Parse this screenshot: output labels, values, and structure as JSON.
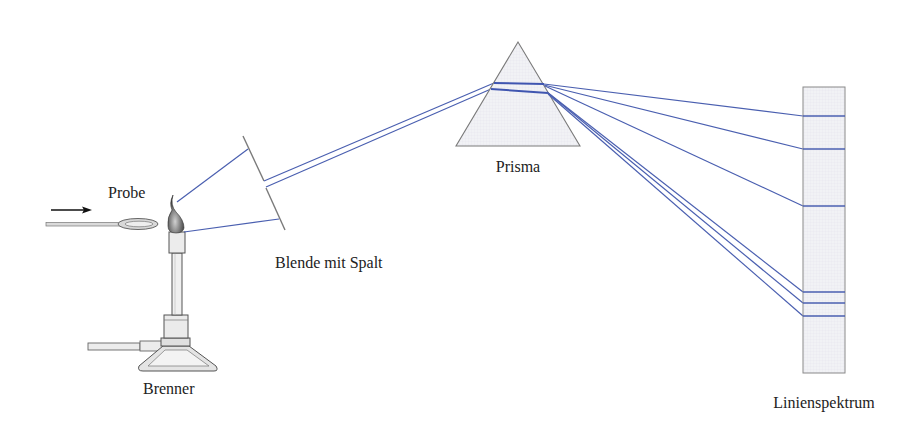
{
  "labels": {
    "probe": "Probe",
    "brenner": "Brenner",
    "blende": "Blende mit Spalt",
    "prisma": "Prisma",
    "spektrum": "Linienspektrum"
  },
  "colors": {
    "ray": "#4a5fb0",
    "outline": "#7a7a7a",
    "fill": "#eef0f4",
    "text": "#222222"
  },
  "components": [
    {
      "id": "probe",
      "description": "sample loop (spoon) with arrow pointing toward flame"
    },
    {
      "id": "brenner",
      "description": "Bunsen burner with flame"
    },
    {
      "id": "blende",
      "description": "aperture with slit"
    },
    {
      "id": "prisma",
      "description": "triangular prism dispersing light"
    },
    {
      "id": "spektrum",
      "description": "screen showing line spectrum"
    }
  ],
  "spectrum_lines_y": [
    116,
    149,
    206,
    292,
    303,
    316
  ]
}
